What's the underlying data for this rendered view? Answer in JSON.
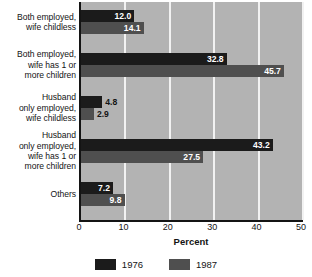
{
  "chart_data": {
    "type": "bar",
    "orientation": "horizontal",
    "title": "",
    "xlabel": "Percent",
    "ylabel": "",
    "xlim": [
      0,
      50
    ],
    "xticks": [
      0,
      10,
      20,
      30,
      40,
      50
    ],
    "xtick_labels": [
      "0",
      "10",
      "20",
      "30",
      "40",
      "50"
    ],
    "grid": true,
    "grid_axis": "x",
    "legend_position": "bottom-center",
    "categories": [
      "Both employed, wife childless",
      "Both employed, wife has 1 or more children",
      "Husband only employed, wife childless",
      "Husband only employed, wife has 1 or more children",
      "Others"
    ],
    "category_lines": [
      [
        "Both employed,",
        "wife childless"
      ],
      [
        "Both employed,",
        "wife has 1 or",
        "more children"
      ],
      [
        "Husband",
        "only employed,",
        "wife childless"
      ],
      [
        "Husband",
        "only employed,",
        "wife has 1 or",
        "more children"
      ],
      [
        "Others"
      ]
    ],
    "series": [
      {
        "name": "1976",
        "color": "#1b1b1b",
        "values": [
          12.0,
          32.8,
          4.8,
          43.2,
          7.2
        ],
        "value_labels": [
          "12.0",
          "32.8",
          "4.8",
          "43.2",
          "7.2"
        ]
      },
      {
        "name": "1987",
        "color": "#4f4f4f",
        "values": [
          14.1,
          45.7,
          2.9,
          27.5,
          9.8
        ],
        "value_labels": [
          "14.1",
          "45.7",
          "2.9",
          "27.5",
          "9.8"
        ]
      }
    ]
  },
  "legend": {
    "items": [
      {
        "label": "1976"
      },
      {
        "label": "1987"
      }
    ]
  },
  "axis": {
    "x_title": "Percent"
  },
  "colors": {
    "series_1976": "#1b1b1b",
    "series_1987": "#4f4f4f",
    "plot_background": "#b3b3b3",
    "gridline": "#f2f2f2",
    "page_background": "#ffffff",
    "text": "#141414"
  }
}
